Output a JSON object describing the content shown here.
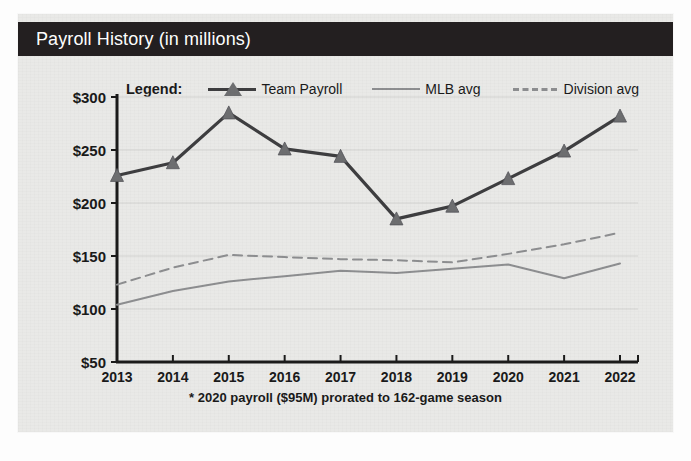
{
  "card": {
    "title": "Payroll History (in millions)",
    "title_bar_color": "#231f20",
    "background_color": "#e9e9e7"
  },
  "legend": {
    "title": "Legend:",
    "entries": [
      {
        "label": "Team Payroll",
        "style": "solid-marker",
        "color": "#3e3e40",
        "marker": "triangle"
      },
      {
        "label": "MLB avg",
        "style": "solid",
        "color": "#8d8e90",
        "marker": "none"
      },
      {
        "label": "Division avg",
        "style": "dashed",
        "color": "#8d8e90",
        "marker": "none"
      }
    ]
  },
  "footnote": "* 2020 payroll ($95M) prorated to 162-game season",
  "chart_data": {
    "type": "line",
    "title": "Payroll History (in millions)",
    "xlabel": "",
    "ylabel": "",
    "grid": true,
    "legend_position": "top",
    "categories": [
      "2013",
      "2014",
      "2015",
      "2016",
      "2017",
      "2018",
      "2019",
      "2020",
      "2021",
      "2022"
    ],
    "x_tick_labels": [
      "2013",
      "2014",
      "2015",
      "2016",
      "2017",
      "2018",
      "2019",
      "2020",
      "2021",
      "2022"
    ],
    "y_tick_labels": [
      "$300",
      "$250",
      "$200",
      "$150",
      "$100",
      "$50"
    ],
    "y_tick_values": [
      300,
      250,
      200,
      150,
      100,
      50
    ],
    "ylim": [
      50,
      300
    ],
    "series": [
      {
        "name": "Team Payroll",
        "color": "#3e3e40",
        "style": "solid",
        "marker": "triangle",
        "values": [
          226,
          238,
          285,
          251,
          244,
          185,
          197,
          223,
          249,
          282
        ]
      },
      {
        "name": "MLB avg",
        "color": "#8d8e90",
        "style": "solid",
        "marker": "none",
        "values": [
          104,
          117,
          126,
          131,
          136,
          134,
          138,
          142,
          129,
          143
        ]
      },
      {
        "name": "Division avg",
        "color": "#8d8e90",
        "style": "dashed",
        "marker": "none",
        "values": [
          123,
          139,
          151,
          149,
          147,
          146,
          144,
          152,
          161,
          172
        ]
      }
    ],
    "annotations": [
      "* 2020 payroll ($95M) prorated to 162-game season"
    ]
  }
}
